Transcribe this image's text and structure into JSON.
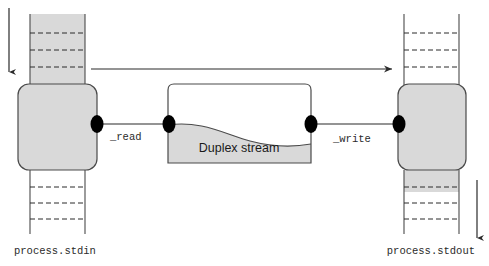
{
  "diagram": {
    "colors": {
      "stroke": "#4a4a4a",
      "dark_stroke": "#2b2b2b",
      "fill_gray": "#d9d9d9",
      "fill_white": "#ffffff",
      "connector": "#000000",
      "text": "#1a1a1a"
    },
    "nodes": {
      "stdin_process": {
        "label": "",
        "fill": "#d9d9d9"
      },
      "stdout_process": {
        "label": "",
        "fill": "#d9d9d9"
      },
      "duplex": {
        "label": "Duplex stream",
        "fill_upper": "#ffffff",
        "fill_lower": "#d9d9d9"
      }
    },
    "edges": {
      "read": {
        "label": "_read"
      },
      "write": {
        "label": "_write"
      },
      "top_flow": {
        "label": ""
      }
    },
    "captions": {
      "stdin": "process.stdin",
      "stdout": "process.stdout"
    },
    "arrows": {
      "left_down": {
        "direction": "down"
      },
      "right_down": {
        "direction": "down"
      },
      "top_right": {
        "direction": "right"
      }
    },
    "buffers": {
      "stdin_top": {
        "fill": "#d9d9d9",
        "dash_count": 3
      },
      "stdin_bottom": {
        "fill": "#ffffff",
        "dash_count": 3
      },
      "stdout_top": {
        "fill": "#ffffff",
        "dash_count": 3
      },
      "stdout_bottom": {
        "fill": "#d9d9d9",
        "dash_count": 3
      }
    }
  }
}
